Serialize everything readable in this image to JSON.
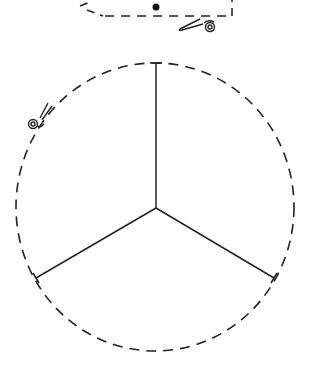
{
  "diagram": {
    "colors": {
      "stroke": "#222222",
      "background": "#ffffff"
    },
    "circle": {
      "cx": 155,
      "cy": 207,
      "rx": 139,
      "ry": 144,
      "style": "dashed"
    },
    "sector_count": 3,
    "icons": [
      "scissors-icon-top",
      "scissors-icon-left"
    ],
    "markers": [
      "center-dot"
    ]
  }
}
